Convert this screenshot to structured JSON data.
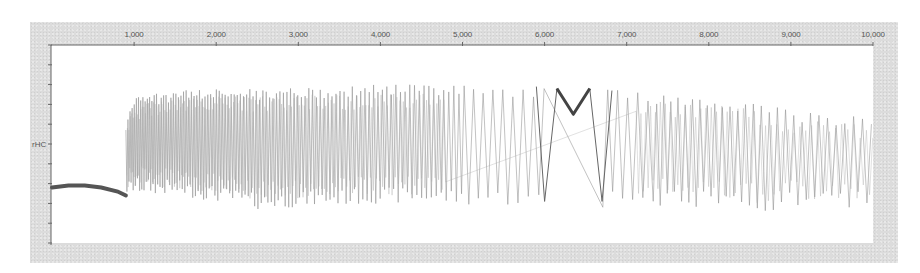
{
  "chart_data": {
    "type": "line",
    "title": "",
    "xlabel": "",
    "ylabel": "rHC",
    "xlim": [
      0,
      10000
    ],
    "x_axis_position": "top",
    "x_ticks": [
      1000,
      2000,
      3000,
      4000,
      5000,
      6000,
      7000,
      8000,
      9000,
      10000
    ],
    "x_tick_labels": [
      "1,000",
      "2,000",
      "3,000",
      "4,000",
      "5,000",
      "6,000",
      "7,000",
      "8,000",
      "9,000",
      "10,000"
    ],
    "y_tick_count": 11,
    "y_tick_labels": [
      "",
      "",
      "",
      "",
      "",
      "rHC",
      "",
      "",
      "",
      "",
      ""
    ],
    "grid": false,
    "legend": null,
    "series": [
      {
        "name": "baseline",
        "description": "Flat/slightly decaying trace before oscillation begins",
        "x": [
          0,
          200,
          400,
          600,
          800,
          900
        ],
        "y_frac": [
          0.72,
          0.71,
          0.71,
          0.72,
          0.74,
          0.76
        ],
        "color": "#555555",
        "width": 4
      },
      {
        "name": "oscillation",
        "description": "Dense oscillating signal; upper envelope (y_top_frac) and lower envelope (y_bot_frac) as fraction of plot height from top",
        "x": [
          900,
          950,
          1000,
          1500,
          2000,
          2500,
          3000,
          3500,
          4000,
          4500,
          5000,
          5500,
          5800,
          6000,
          7000,
          7500,
          8000,
          8500,
          8750,
          9000,
          9500,
          10000
        ],
        "y_top_frac": [
          0.4,
          0.3,
          0.26,
          0.23,
          0.22,
          0.22,
          0.21,
          0.21,
          0.2,
          0.2,
          0.2,
          0.2,
          0.21,
          0.21,
          0.23,
          0.25,
          0.26,
          0.28,
          0.3,
          0.33,
          0.35,
          0.36
        ],
        "y_bot_frac": [
          0.76,
          0.76,
          0.75,
          0.76,
          0.79,
          0.83,
          0.82,
          0.81,
          0.8,
          0.8,
          0.81,
          0.81,
          0.82,
          0.82,
          0.82,
          0.81,
          0.82,
          0.83,
          0.85,
          0.82,
          0.82,
          0.82
        ],
        "period_start": 25,
        "period_end": 110,
        "color": "#8a8a8a"
      },
      {
        "name": "v-notch",
        "description": "Bold V-shaped segment near x≈6,200",
        "x": [
          6150,
          6350,
          6550
        ],
        "y_frac": [
          0.22,
          0.35,
          0.22
        ],
        "color": "#444444",
        "width": 3
      }
    ],
    "gaps": [
      {
        "x_start": 6000,
        "x_end": 6700,
        "trough_y_frac": 0.79,
        "note": "sparse wide swings around the V-notch"
      }
    ]
  }
}
